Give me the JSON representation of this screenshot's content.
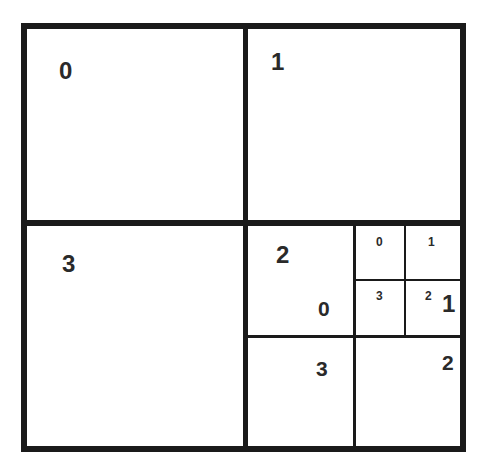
{
  "diagram": {
    "type": "quadtree-subdivision",
    "level0": {
      "quadrants": [
        {
          "id": "0",
          "label": "0"
        },
        {
          "id": "1",
          "label": "1"
        },
        {
          "id": "2",
          "label": "2",
          "subdivided": true
        },
        {
          "id": "3",
          "label": "3"
        }
      ]
    },
    "level1": {
      "parent": "2",
      "quadrants": [
        {
          "id": "0",
          "label": "0",
          "subdivided": true
        },
        {
          "id": "1",
          "label": "1"
        },
        {
          "id": "2",
          "label": "2"
        },
        {
          "id": "3",
          "label": "3"
        }
      ]
    },
    "level2": {
      "parent": "2.0",
      "quadrants": [
        {
          "id": "0",
          "label": "0"
        },
        {
          "id": "1",
          "label": "1"
        },
        {
          "id": "2",
          "label": "2"
        },
        {
          "id": "3",
          "label": "3"
        }
      ]
    },
    "caption": ""
  },
  "colors": {
    "line": "#1a1a1a",
    "text": "#2a2a2a",
    "background": "#ffffff"
  }
}
